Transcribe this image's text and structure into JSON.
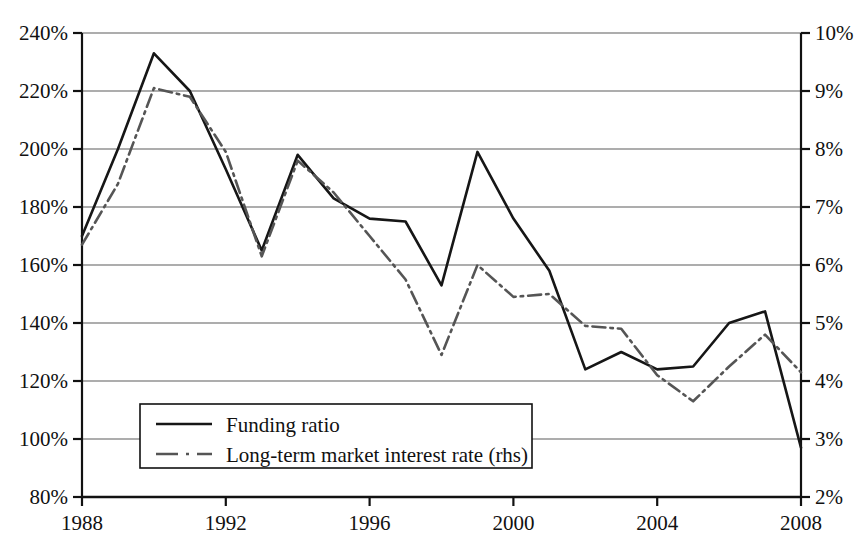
{
  "chart_data": {
    "type": "line",
    "title": "",
    "subtitle": "",
    "xlabel": "",
    "ylabel": "",
    "y2label": "",
    "grid": true,
    "legend_position": "bottom-left",
    "x": [
      1988,
      1989,
      1990,
      1991,
      1992,
      1993,
      1994,
      1995,
      1996,
      1997,
      1998,
      1999,
      2000,
      2001,
      2002,
      2003,
      2004,
      2005,
      2006,
      2007,
      2008
    ],
    "xlim": [
      1988,
      2008
    ],
    "xticks": [
      1988,
      1992,
      1996,
      2000,
      2004,
      2008
    ],
    "xtick_labels": [
      "1988",
      "1992",
      "1996",
      "2000",
      "2004",
      "2008"
    ],
    "ylim": [
      80,
      240
    ],
    "yticks": [
      80,
      100,
      120,
      140,
      160,
      180,
      200,
      220,
      240
    ],
    "ytick_labels": [
      "80%",
      "100%",
      "120%",
      "140%",
      "160%",
      "180%",
      "200%",
      "220%",
      "240%"
    ],
    "y2lim": [
      2,
      10
    ],
    "y2ticks": [
      2,
      3,
      4,
      5,
      6,
      7,
      8,
      9,
      10
    ],
    "y2tick_labels": [
      "2%",
      "3%",
      "4%",
      "5%",
      "6%",
      "7%",
      "8%",
      "9%",
      "10%"
    ],
    "series": [
      {
        "name": "Funding ratio",
        "axis": "left",
        "style": "solid",
        "color": "#161616",
        "width": 2.6,
        "values": [
          170,
          200,
          233,
          220,
          193,
          165,
          198,
          183,
          176,
          175,
          153,
          199,
          176,
          158,
          124,
          130,
          124,
          125,
          140,
          144,
          97
        ]
      },
      {
        "name": "Long-term market interest rate (rhs)",
        "axis": "right",
        "style": "dash-dot",
        "color": "#555555",
        "width": 2.6,
        "values": [
          6.35,
          7.4,
          9.05,
          8.9,
          7.95,
          6.15,
          7.8,
          7.25,
          6.5,
          5.75,
          4.45,
          6.0,
          5.45,
          5.5,
          4.95,
          4.9,
          4.1,
          3.65,
          4.25,
          4.8,
          4.15
        ]
      }
    ]
  },
  "legend": {
    "entries": [
      {
        "label": "Funding ratio",
        "style": "solid"
      },
      {
        "label": "Long-term market interest rate (rhs)",
        "style": "dash-dot"
      }
    ]
  }
}
